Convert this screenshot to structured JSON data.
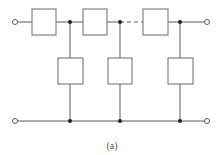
{
  "diagram": {
    "type": "ladder-network",
    "caption": "(a)",
    "colors": {
      "line": "#5a5a5a",
      "box_fill": "#ffffff",
      "node": "#222222"
    },
    "series_elements": 3,
    "shunt_elements": 3,
    "series_gap": "dashed (repeated sections omitted)",
    "terminals": [
      "input-top",
      "input-bottom",
      "output-top",
      "output-bottom"
    ]
  }
}
